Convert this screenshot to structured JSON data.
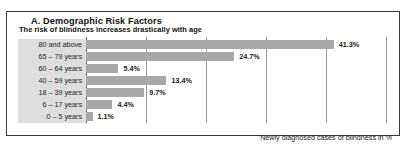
{
  "panel": {
    "title": "A. Demographic Risk Factors"
  },
  "subtitle": "The risk of blindness increases drastically with age",
  "axis_caption": "Newly diagnosed cases of blindness in %",
  "colors": {
    "bar": "#a8a8a8",
    "label_band": "#dedede",
    "gridline": "#9a9a9a",
    "border": "#3a3a3a",
    "text": "#1a1a1a"
  },
  "chart_data": {
    "type": "bar",
    "orientation": "horizontal",
    "title": "The risk of blindness increases drastically with age",
    "xlabel": "Newly diagnosed cases of blindness in %",
    "ylabel": "",
    "categories": [
      "80 and above",
      "65 – 79 years",
      "60 – 64 years",
      "40 – 59 years",
      "18 – 39 years",
      "6 – 17 years",
      "0 –  5 years"
    ],
    "values": [
      41.3,
      24.7,
      5.4,
      13.4,
      9.7,
      4.4,
      1.1
    ],
    "data_labels": [
      "41.3%",
      "24.7%",
      "5.4%",
      "13.4%",
      "9.7%",
      "4.4%",
      "1.1%"
    ],
    "xlim": [
      0,
      50
    ],
    "gridlines": [
      10,
      20,
      30,
      40,
      50
    ],
    "grid": true,
    "legend": "none"
  }
}
